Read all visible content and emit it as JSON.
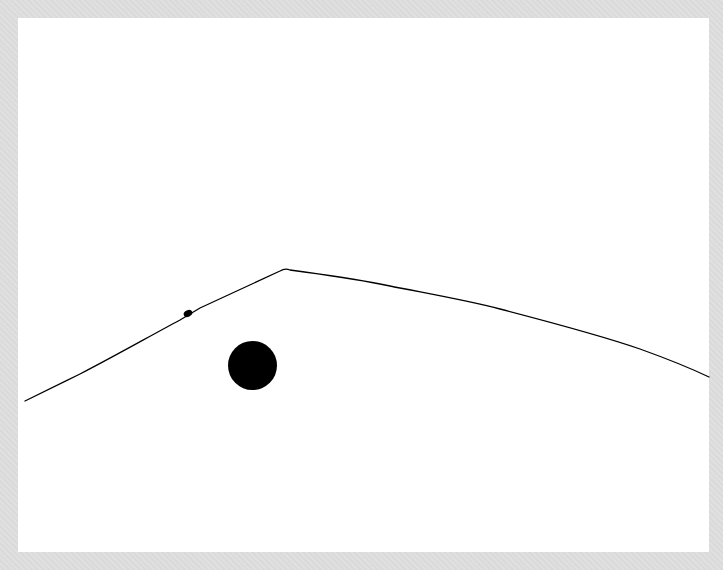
{
  "image": {
    "description": "Minimalist ink drawing on white paper: a single thin line forming a hill/mountain ridge with a small bump on its left slope and a large solid black circle below the left slope",
    "background_color": "#dedede",
    "paper_color": "#ffffff",
    "ink_color": "#000000",
    "paper_bounds": {
      "x": 18,
      "y": 18,
      "width": 691,
      "height": 534
    }
  },
  "ridge_line": {
    "points": [
      [
        25,
        401
      ],
      [
        80,
        374
      ],
      [
        180,
        320
      ],
      [
        200,
        308
      ],
      [
        280,
        270
      ],
      [
        286,
        269
      ],
      [
        290,
        270
      ],
      [
        380,
        284
      ],
      [
        390,
        286
      ],
      [
        500,
        309
      ],
      [
        640,
        349
      ],
      [
        709,
        377
      ]
    ],
    "stroke_width": 1.3
  },
  "small_bump": {
    "cx": 188,
    "cy": 313.5,
    "rx": 4.5,
    "ry": 3.2
  },
  "large_circle": {
    "cx": 252.5,
    "cy": 365.5,
    "r": 24.5
  }
}
